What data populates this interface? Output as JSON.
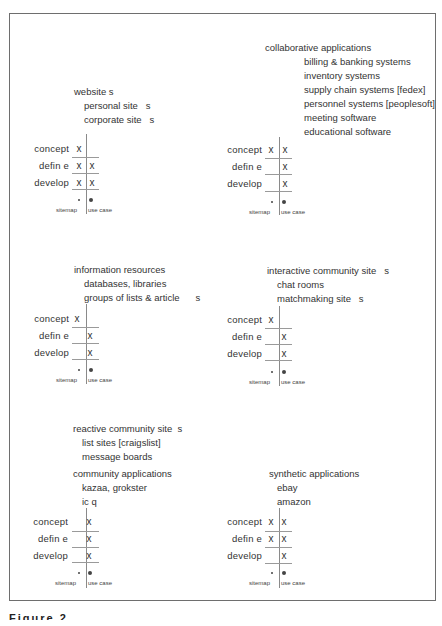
{
  "figure": {
    "caption": "Figure 2"
  },
  "grid_labels": {
    "rows": [
      "concept",
      "defin e",
      "develop"
    ],
    "columns": [
      "sitemap",
      "use case"
    ]
  },
  "panels": [
    {
      "title": "website s",
      "items": [
        "personal site   s",
        "corporate site   s"
      ],
      "marks": [
        [
          "x",
          ""
        ],
        [
          "x",
          "x"
        ],
        [
          "x",
          "x"
        ]
      ]
    },
    {
      "title": "collaborative applications",
      "items": [
        "billing & banking systems",
        "inventory systems",
        "supply chain systems [fedex]",
        "personnel systems [peoplesoft]",
        "meeting software",
        "educational software"
      ],
      "marks": [
        [
          "x",
          "x"
        ],
        [
          "",
          "x"
        ],
        [
          "",
          "x"
        ]
      ]
    },
    {
      "title": "information resources",
      "items": [
        "databases, libraries",
        "groups of lists & article      s"
      ],
      "marks": [
        [
          "x",
          ""
        ],
        [
          "",
          "x"
        ],
        [
          "",
          "x"
        ]
      ]
    },
    {
      "title": "interactive community site   s",
      "items": [
        "chat rooms",
        "matchmaking site   s"
      ],
      "marks": [
        [
          "x",
          ""
        ],
        [
          "",
          "x"
        ],
        [
          "",
          "x"
        ]
      ]
    },
    {
      "title": "reactive community site  s",
      "items": [
        "list sites [craigslist]",
        "message boards"
      ],
      "title2": "community applications",
      "items2": [
        "kazaa, grokster",
        "ic q"
      ],
      "marks": [
        [
          "",
          "x"
        ],
        [
          "",
          "x"
        ],
        [
          "",
          "x"
        ]
      ]
    },
    {
      "title": "synthetic applications",
      "items": [
        "ebay",
        "amazon"
      ],
      "marks": [
        [
          "x",
          "x"
        ],
        [
          "x",
          "x"
        ],
        [
          "",
          "x"
        ]
      ]
    }
  ]
}
